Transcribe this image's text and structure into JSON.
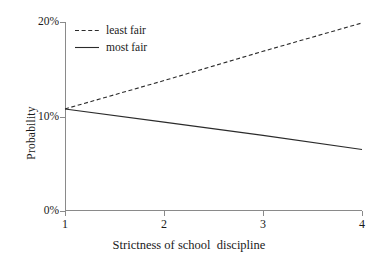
{
  "chart_data": {
    "type": "line",
    "title": "",
    "subtitle": "",
    "xlabel": "Strictness of school  discipline",
    "ylabel": "Probability",
    "x": [
      1,
      2,
      3,
      4
    ],
    "xlim": [
      1,
      4
    ],
    "ylim": [
      0,
      20
    ],
    "xticks": [
      "1",
      "2",
      "3",
      "4"
    ],
    "yticks": [
      "0%",
      "10%",
      "20%"
    ],
    "ytick_values": [
      0,
      10,
      20
    ],
    "grid": false,
    "legend_position": "top-left inside plot",
    "series": [
      {
        "name": "least fair",
        "style": "dashed",
        "color": "#2b2b2b",
        "values": [
          10.8,
          13.8,
          16.9,
          19.9
        ]
      },
      {
        "name": "most fair",
        "style": "solid",
        "color": "#2b2b2b",
        "values": [
          10.8,
          9.4,
          8.0,
          6.5
        ]
      }
    ],
    "annotations": []
  },
  "legend": {
    "items": [
      {
        "label": "least fair",
        "style": "dashed"
      },
      {
        "label": "most fair",
        "style": "solid"
      }
    ]
  },
  "axes": {
    "y_title": "Probability",
    "x_title": "Strictness of school  discipline",
    "y_tick_labels": [
      "20%",
      "10%",
      "0%"
    ],
    "x_tick_labels": [
      "1",
      "2",
      "3",
      "4"
    ],
    "axis_color": "#8a8a8a"
  }
}
